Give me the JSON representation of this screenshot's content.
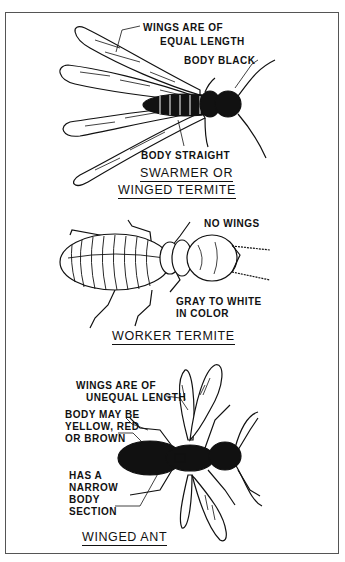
{
  "figure": {
    "sections": [
      {
        "title_line1": "SWARMER OR",
        "title_line2": "WINGED TERMITE",
        "labels": {
          "wings": [
            "WINGS ARE OF",
            "EQUAL LENGTH"
          ],
          "body_color": "BODY BLACK",
          "body_shape": "BODY STRAIGHT"
        }
      },
      {
        "title": "WORKER TERMITE",
        "labels": {
          "wings": "NO WINGS",
          "color": [
            "GRAY TO WHITE",
            "IN COLOR"
          ]
        }
      },
      {
        "title": "WINGED ANT",
        "labels": {
          "wings": [
            "WINGS ARE OF",
            "UNEQUAL LENGTH"
          ],
          "body_color": [
            "BODY MAY BE",
            "YELLOW, RED",
            "OR BROWN"
          ],
          "body_shape": [
            "HAS A",
            "NARROW",
            "BODY",
            "SECTION"
          ]
        }
      }
    ]
  }
}
